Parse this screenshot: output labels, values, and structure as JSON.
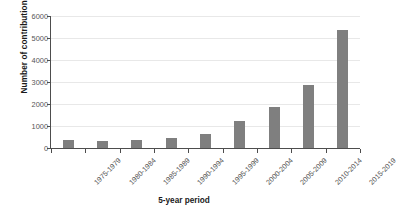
{
  "chart_data": {
    "type": "bar",
    "title": "",
    "xlabel": "5-year period",
    "ylabel": "Number of contributions",
    "categories": [
      "1975-1979",
      "1980-1984",
      "1985-1989",
      "1990-1994",
      "1995-1999",
      "2000-2004",
      "2005-2009",
      "2010-2014",
      "2015-2019"
    ],
    "values": [
      360,
      310,
      350,
      440,
      620,
      1220,
      1850,
      2880,
      5380
    ],
    "ylim": [
      0,
      6000
    ],
    "yticks": [
      0,
      1000,
      2000,
      3000,
      4000,
      5000,
      6000
    ],
    "ytick_labels": [
      "0",
      "1000",
      "2000",
      "3000",
      "4000",
      "5000",
      "6000"
    ],
    "grid": true,
    "legend": false,
    "bar_color": "#7f7f7f",
    "gridline_color": "#e8e8e8",
    "axis_color": "#4d4d4d",
    "background_color": "#ffffff",
    "xtick_label_rotation": -45
  }
}
